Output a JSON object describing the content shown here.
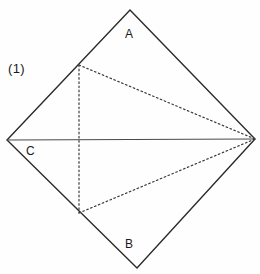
{
  "figure": {
    "caption": "(1)",
    "width": 260,
    "height": 274,
    "background_color": "#fefefe",
    "stroke_color": "#2b2b2b",
    "dotted_color": "#3a3a3a",
    "labels": {
      "vertex_a": "A",
      "vertex_b": "B",
      "vertex_c": "C"
    },
    "geometry": {
      "quadrilateral": {
        "name": "outer-diamond",
        "style": "solid",
        "points": "130,10 255,139 137,268 7,140",
        "vertices": [
          {
            "name": "top",
            "label": "A",
            "x": 130,
            "y": 10
          },
          {
            "name": "right",
            "label": "",
            "x": 255,
            "y": 139
          },
          {
            "name": "bottom",
            "label": "B",
            "x": 137,
            "y": 268
          },
          {
            "name": "left",
            "label": "C",
            "x": 7,
            "y": 140
          }
        ]
      },
      "solid_segments": [
        {
          "name": "horizontal-diagonal",
          "x1": 7,
          "y1": 140,
          "x2": 255,
          "y2": 139
        }
      ],
      "dotted_segments": [
        {
          "name": "vertical-chord",
          "x1": 79,
          "y1": 65,
          "x2": 79,
          "y2": 213
        },
        {
          "name": "upper-diagonal-chord",
          "x1": 79,
          "y1": 65,
          "x2": 255,
          "y2": 139
        },
        {
          "name": "lower-diagonal-chord",
          "x1": 79,
          "y1": 213,
          "x2": 255,
          "y2": 139
        }
      ]
    }
  }
}
